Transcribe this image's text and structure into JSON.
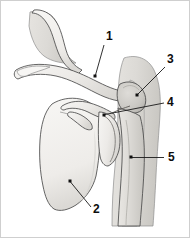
{
  "figure": {
    "background_color": "#ffffff",
    "width": 190,
    "height": 238,
    "border_color": "#cfcfcf"
  },
  "palette": {
    "bone_fill_light": "#f2f1ef",
    "bone_fill_mid": "#e3e2df",
    "bone_fill_dark": "#cdcbc7",
    "soft_tissue_fill": "#dedcd8",
    "soft_tissue_shadow": "#c9c7c2",
    "outline": "#4a4a4a",
    "soft_outline": "#8e8e8e",
    "label_color": "#0d0d0d",
    "leader_color": "#1a1a1a"
  },
  "labels": [
    {
      "id": "label-1",
      "text": "1",
      "text_x": 106,
      "text_y": 40,
      "dot_x": 95,
      "dot_y": 76,
      "line": "M 104 45 L 95.5 75"
    },
    {
      "id": "label-2",
      "text": "2",
      "text_x": 93,
      "text_y": 213,
      "dot_x": 70,
      "dot_y": 181,
      "line": "M 91 207 L 70.5 182"
    },
    {
      "id": "label-3",
      "text": "3",
      "text_x": 167,
      "text_y": 63,
      "dot_x": 137,
      "dot_y": 95,
      "line": "M 165 67 L 138 94"
    },
    {
      "id": "label-4",
      "text": "4",
      "text_x": 167,
      "text_y": 106,
      "dot_x": 104,
      "dot_y": 115,
      "line": "M 164 103 L 105 114.5"
    },
    {
      "id": "label-5",
      "text": "5",
      "text_x": 168,
      "text_y": 161,
      "dot_x": 131,
      "dot_y": 157,
      "line": "M 164 157.5 L 132 157.5"
    }
  ],
  "structures": [
    {
      "name": "rib-cage-upper",
      "description": "Upper thoracic rib / chest wall outline, upper-left"
    },
    {
      "name": "clavicle",
      "description": "Clavicle (collar bone), horizontal S-curved bone"
    },
    {
      "name": "scapula-body",
      "description": "Scapula (shoulder blade) large triangular plate"
    },
    {
      "name": "acromion",
      "description": "Acromion process of the scapula"
    },
    {
      "name": "coracoid-process",
      "description": "Coracoid process projecting anteriorly"
    },
    {
      "name": "glenoid-cavity",
      "description": "Glenoid fossa articulating with the humeral head"
    },
    {
      "name": "humeral-head",
      "description": "Rounded head of the humerus"
    },
    {
      "name": "humerus-shaft",
      "description": "Shaft of the humerus descending inferiorly"
    },
    {
      "name": "acromioclavicular-joint",
      "description": "AC joint region between clavicle and acromion"
    },
    {
      "name": "soft-tissue-envelope",
      "description": "Surrounding muscle and soft tissue silhouette"
    }
  ]
}
